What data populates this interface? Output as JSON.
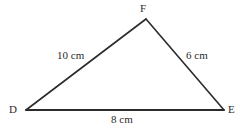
{
  "figure": {
    "type": "triangle-diagram",
    "background_color": "#ffffff",
    "stroke_color": "#2b2b2b",
    "stroke_width": 1.6,
    "width": 242,
    "height": 128
  },
  "vertices": [
    {
      "name": "F",
      "label": "F",
      "x": 146,
      "y": 19
    },
    {
      "name": "D",
      "label": "D",
      "x": 26,
      "y": 110
    },
    {
      "name": "E",
      "label": "E",
      "x": 224,
      "y": 110
    }
  ],
  "sides": [
    {
      "name": "DF",
      "label": "10 cm",
      "value": 10,
      "unit": "cm"
    },
    {
      "name": "FE",
      "label": "6 cm",
      "value": 6,
      "unit": "cm"
    },
    {
      "name": "DE",
      "label": "8 cm",
      "value": 8,
      "unit": "cm"
    }
  ]
}
